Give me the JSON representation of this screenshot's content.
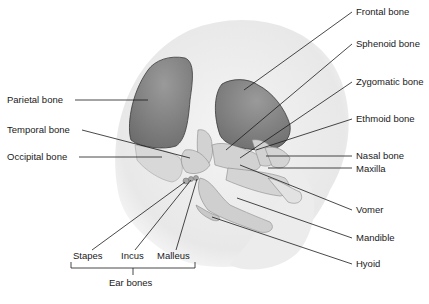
{
  "diagram": {
    "labels": {
      "frontal": "Frontal bone",
      "sphenoid": "Sphenoid bone",
      "zygomatic": "Zygomatic bone",
      "ethmoid": "Ethmoid bone",
      "nasal": "Nasal bone",
      "maxilla": "Maxilla",
      "vomer": "Vomer",
      "mandible": "Mandible",
      "hyoid": "Hyoid",
      "parietal": "Parietal bone",
      "temporal": "Temporal bone",
      "occipital": "Occipital bone",
      "stapes": "Stapes",
      "incus": "Incus",
      "malleus": "Malleus",
      "ear_group": "Ear bones"
    },
    "colors": {
      "background": "#ffffff",
      "head_silhouette": "#ededed",
      "ossified_plate": "#7d7d7d",
      "bone_light": "#d6d6d6",
      "leader_line": "#1a1a1a",
      "text": "#1a1a1a"
    }
  }
}
